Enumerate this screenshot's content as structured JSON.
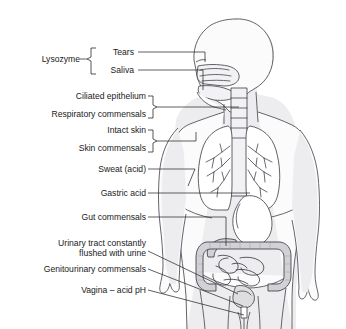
{
  "figure": {
    "view": "anterior whole-body schematic with internal organs"
  },
  "labels": [
    {
      "id": "lysozyme",
      "text": "Lysozyme",
      "role": "bracket-group-label",
      "x": 88,
      "y": 62
    },
    {
      "id": "tears",
      "text": "Tears",
      "role": "leader-label",
      "x": 135,
      "y": 55,
      "target": "eye"
    },
    {
      "id": "saliva",
      "text": "Saliva",
      "role": "leader-label",
      "x": 135,
      "y": 73,
      "target": "mouth-oral-cavity"
    },
    {
      "id": "ciliated-epithelium",
      "text": "Ciliated epithelium",
      "role": "leader-label",
      "x": 143,
      "y": 100,
      "target": "trachea-airway"
    },
    {
      "id": "respiratory-commensals",
      "text": "Respiratory commensals",
      "role": "leader-label",
      "x": 143,
      "y": 114,
      "target": "trachea-airway"
    },
    {
      "id": "intact-skin",
      "text": "Intact skin",
      "role": "leader-label",
      "x": 143,
      "y": 134,
      "target": "shoulder-skin"
    },
    {
      "id": "skin-commensals",
      "text": "Skin commensals",
      "role": "leader-label",
      "x": 143,
      "y": 148,
      "target": "shoulder-skin"
    },
    {
      "id": "sweat-acid",
      "text": "Sweat (acid)",
      "role": "leader-label",
      "x": 143,
      "y": 172,
      "target": "arm-skin"
    },
    {
      "id": "gastric-acid",
      "text": "Gastric acid",
      "role": "leader-label",
      "x": 143,
      "y": 196,
      "target": "stomach"
    },
    {
      "id": "gut-commensals",
      "text": "Gut commensals",
      "role": "leader-label",
      "x": 143,
      "y": 220,
      "target": "large-intestine"
    },
    {
      "id": "urinary-tract-line-1",
      "text": "Urinary tract constantly",
      "role": "leader-label",
      "x": 143,
      "y": 242,
      "target": "bladder-urethra"
    },
    {
      "id": "urinary-tract-line-2",
      "text": "flushed with urine",
      "role": "leader-label",
      "x": 143,
      "y": 254,
      "target": "bladder-urethra"
    },
    {
      "id": "genitourinary-commensals",
      "text": "Genitourinary commensals",
      "role": "leader-label",
      "x": 143,
      "y": 272,
      "target": "genitourinary-tract"
    },
    {
      "id": "vagina-acid-ph",
      "text": "Vagina – acid pH",
      "role": "leader-label",
      "x": 143,
      "y": 293,
      "target": "vagina"
    }
  ],
  "anatomy_parts": [
    {
      "id": "head",
      "name": "head-profile"
    },
    {
      "id": "nasal-cavity",
      "name": "nasal-cavity"
    },
    {
      "id": "oral-cavity",
      "name": "oral-cavity"
    },
    {
      "id": "trachea",
      "name": "trachea"
    },
    {
      "id": "left-lung",
      "name": "left-lung"
    },
    {
      "id": "right-lung",
      "name": "right-lung"
    },
    {
      "id": "bronchial-tree",
      "name": "bronchial-tree"
    },
    {
      "id": "stomach",
      "name": "stomach"
    },
    {
      "id": "large-intestine",
      "name": "large-intestine-colon"
    },
    {
      "id": "small-intestine",
      "name": "small-intestine"
    },
    {
      "id": "bladder",
      "name": "urinary-bladder"
    },
    {
      "id": "urethra",
      "name": "urethra"
    },
    {
      "id": "torso",
      "name": "torso-outline"
    },
    {
      "id": "left-arm",
      "name": "left-arm"
    },
    {
      "id": "right-arm",
      "name": "right-arm"
    },
    {
      "id": "legs",
      "name": "legs"
    }
  ],
  "colors": {
    "background": "#ffffff",
    "outline": "#4a4a52",
    "skin_shade": "#ededf0",
    "head_shade": "#d9d9de",
    "organ_fill": "#ffffff",
    "colon_fill": "#d2d2d6",
    "leader_line": "#2b2b2b",
    "text": "#1a1a1a"
  }
}
